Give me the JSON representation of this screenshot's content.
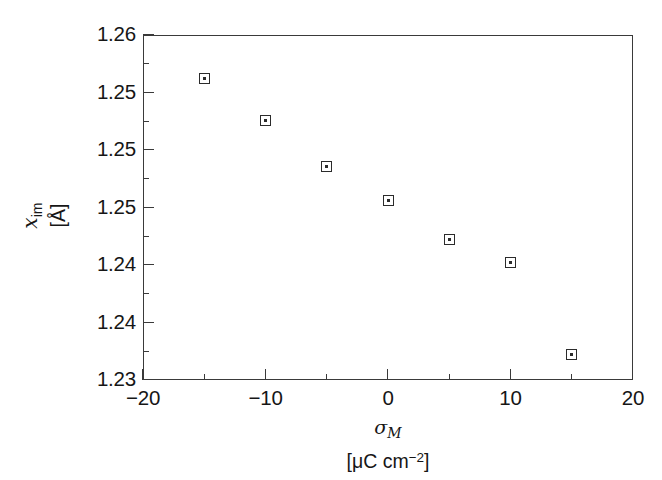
{
  "chart_data": {
    "type": "scatter",
    "title": "",
    "xlabel": "σ_M [μC cm⁻²]",
    "ylabel": "x_im [Å]",
    "xlim": [
      -20,
      20
    ],
    "ylim": [
      1.23,
      1.26
    ],
    "grid": false,
    "legend": null,
    "marker": "open-square-with-center-dot",
    "x": [
      -15,
      -10,
      -5,
      0,
      5,
      10,
      15
    ],
    "values": [
      1.2562,
      1.2526,
      1.2486,
      1.2456,
      1.2422,
      1.2402,
      1.2322
    ],
    "series": [
      {
        "name": "x_im",
        "points": [
          {
            "x": -15,
            "y": 1.2562
          },
          {
            "x": -10,
            "y": 1.2526
          },
          {
            "x": -5,
            "y": 1.2486
          },
          {
            "x": 0,
            "y": 1.2456
          },
          {
            "x": 5,
            "y": 1.2422
          },
          {
            "x": 10,
            "y": 1.2402
          },
          {
            "x": 15,
            "y": 1.2322
          }
        ]
      }
    ],
    "x_ticks_major": [
      -20,
      -10,
      0,
      10,
      20
    ],
    "x_tick_labels": [
      "−20",
      "−10",
      "0",
      "10",
      "20"
    ],
    "x_ticks_minor": [
      -15,
      -5,
      5,
      15
    ],
    "y_ticks_major": [
      1.26,
      1.255,
      1.25,
      1.245,
      1.24,
      1.235,
      1.23
    ],
    "y_tick_labels": [
      "1.26",
      "1.25",
      "1.25",
      "1.25",
      "1.24",
      "1.24",
      "1.23"
    ],
    "y_ticks_minor": [
      1.2575,
      1.2525,
      1.2475,
      1.2425,
      1.2375,
      1.2325
    ]
  },
  "axes": {
    "y_title_var": "x",
    "y_title_sub": "im",
    "y_title_units": "[Å]",
    "x_title_sym": "σ",
    "x_title_sub": "M",
    "x_title_units_open": "[μC cm",
    "x_title_units_sup": "−2",
    "x_title_units_close": "]"
  },
  "style": {
    "axis_color": "#3a3a3a",
    "marker_edge": "#2b2b2b",
    "marker_face": "#ffffff",
    "text_color": "#161616",
    "background": "#ffffff"
  }
}
